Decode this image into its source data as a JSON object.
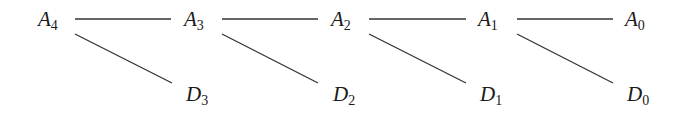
{
  "diagram": {
    "top_nodes": [
      {
        "letter": "A",
        "index": "4",
        "x": 38
      },
      {
        "letter": "A",
        "index": "3",
        "x": 184
      },
      {
        "letter": "A",
        "index": "2",
        "x": 330
      },
      {
        "letter": "A",
        "index": "1",
        "x": 477
      },
      {
        "letter": "A",
        "index": "0",
        "x": 625
      }
    ],
    "bottom_nodes": [
      {
        "letter": "D",
        "index": "3",
        "x": 186
      },
      {
        "letter": "D",
        "index": "2",
        "x": 333
      },
      {
        "letter": "D",
        "index": "1",
        "x": 480
      },
      {
        "letter": "D",
        "index": "0",
        "x": 627
      }
    ],
    "edges": [
      {
        "from": "A4",
        "to": "A3"
      },
      {
        "from": "A3",
        "to": "A2"
      },
      {
        "from": "A2",
        "to": "A1"
      },
      {
        "from": "A1",
        "to": "A0"
      },
      {
        "from": "A4",
        "to": "D3"
      },
      {
        "from": "A3",
        "to": "D2"
      },
      {
        "from": "A2",
        "to": "D1"
      },
      {
        "from": "A1",
        "to": "D0"
      }
    ],
    "line_color": "#333333"
  }
}
